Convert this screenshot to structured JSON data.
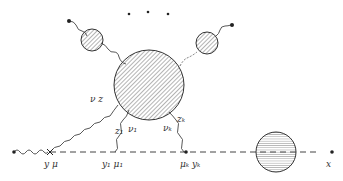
{
  "diagram": {
    "type": "feynman-like propagator expansion diagram",
    "colors": {
      "ink": "#333333",
      "background": "#ffffff"
    },
    "labels": {
      "nu_z": "ν z",
      "z1": "z₁",
      "nu1": "ν₁",
      "nuk": "νₖ",
      "zk": "zₖ",
      "y_mu": "y μ",
      "y1_mu1": "y₁ μ₁",
      "muk_yk": "μₖ yₖ",
      "x": "x"
    },
    "ellipsis": "• • •",
    "nodes": [
      {
        "id": "big-blob",
        "shape": "circle",
        "fill": "diagonal-hatch"
      },
      {
        "id": "left-small-blob",
        "shape": "circle",
        "fill": "diagonal-hatch"
      },
      {
        "id": "right-small-blob",
        "shape": "circle",
        "fill": "diagonal-hatch"
      },
      {
        "id": "propagator-blob",
        "shape": "circle",
        "fill": "horizontal-hatch"
      }
    ]
  }
}
